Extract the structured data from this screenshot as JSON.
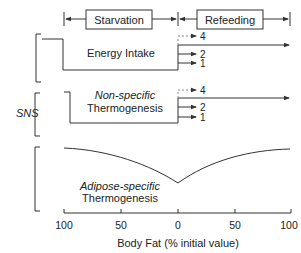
{
  "phases": {
    "starvation": "Starvation",
    "refeeding": "Refeeding"
  },
  "panels": {
    "energy_intake": {
      "label": "Energy Intake",
      "outcomes": [
        "4",
        "2",
        "1"
      ]
    },
    "non_specific": {
      "label_italic": "Non-specific",
      "label": "Thermogenesis",
      "outcomes": [
        "4",
        "2",
        "1"
      ]
    },
    "adipose_specific": {
      "label_italic": "Adipose-specific",
      "label": "Thermogenesis"
    }
  },
  "group_label": "SNS",
  "axis": {
    "title": "Body Fat (% initial value)",
    "ticks": [
      "100",
      "50",
      "0",
      "50",
      "100"
    ]
  },
  "colors": {
    "line": "#333333",
    "dashed": "#888888"
  }
}
